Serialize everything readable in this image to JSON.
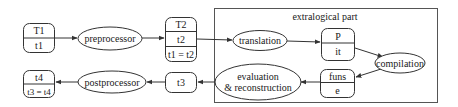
{
  "diagram": {
    "frame": {
      "label": "extralogical part"
    },
    "nodes": {
      "t1_box": {
        "rows": [
          "T1",
          "t1"
        ]
      },
      "preprocessor": {
        "label": "preprocessor"
      },
      "t2_box": {
        "rows": [
          "T2",
          "t2",
          "t1 = t2"
        ]
      },
      "translation": {
        "label": "translation"
      },
      "p_box": {
        "rows": [
          "P",
          "it"
        ]
      },
      "compilation": {
        "label": "compilation"
      },
      "funs_box": {
        "rows": [
          "funs",
          "e"
        ]
      },
      "evaluation": {
        "lines": [
          "evaluation",
          "& reconstruction"
        ]
      },
      "t3_box": {
        "rows": [
          "t3"
        ]
      },
      "postprocessor": {
        "label": "postprocessor"
      },
      "t4_box": {
        "rows": [
          "t4",
          "t3 = t4"
        ]
      }
    },
    "edges": [
      {
        "from": "T1/t1",
        "to": "preprocessor"
      },
      {
        "from": "preprocessor",
        "to": "T2/t2"
      },
      {
        "from": "T2/t2",
        "to": "translation"
      },
      {
        "from": "translation",
        "to": "P/it"
      },
      {
        "from": "P/it",
        "to": "compilation"
      },
      {
        "from": "compilation",
        "to": "funs/e"
      },
      {
        "from": "funs/e",
        "to": "evaluation & reconstruction"
      },
      {
        "from": "evaluation & reconstruction",
        "to": "t3"
      },
      {
        "from": "t3",
        "to": "postprocessor"
      },
      {
        "from": "postprocessor",
        "to": "t4/t3=t4"
      }
    ],
    "colors": {
      "stroke": "#333333",
      "text": "#1a1a1a",
      "background": "#ffffff"
    }
  }
}
